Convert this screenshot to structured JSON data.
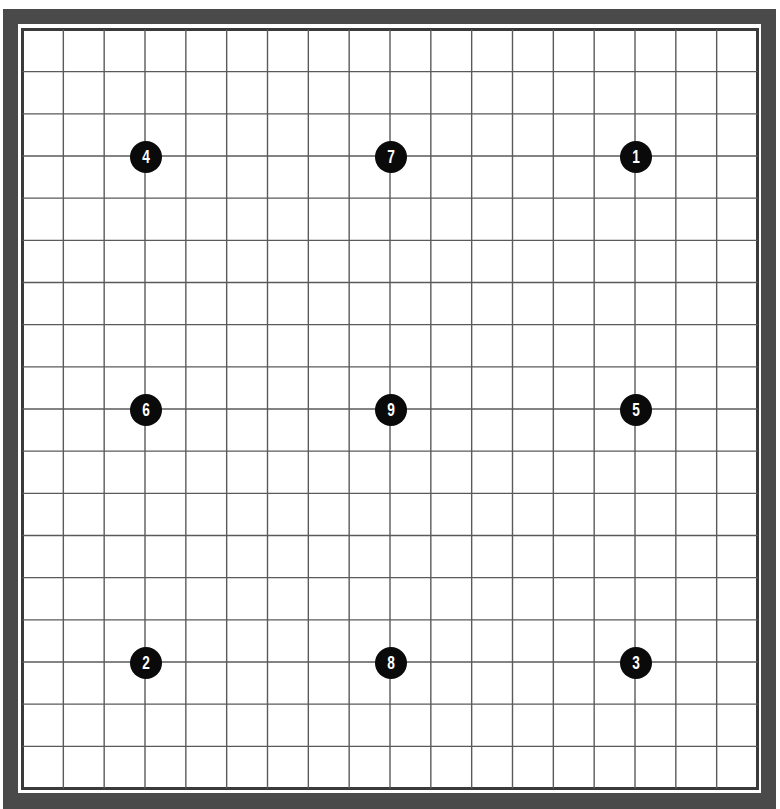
{
  "board": {
    "size": 19,
    "colors": {
      "background": "#ffffff",
      "frame": "#4a4a4a",
      "inner_frame": "#3a3a3a",
      "grid_line": "#5a5a5a",
      "stone": "#0a0a0a",
      "stone_label": "#ffffff"
    },
    "stones": [
      {
        "label": "1",
        "col": 15,
        "row": 3,
        "color": "black"
      },
      {
        "label": "2",
        "col": 3,
        "row": 15,
        "color": "black"
      },
      {
        "label": "3",
        "col": 15,
        "row": 15,
        "color": "black"
      },
      {
        "label": "4",
        "col": 3,
        "row": 3,
        "color": "black"
      },
      {
        "label": "5",
        "col": 15,
        "row": 9,
        "color": "black"
      },
      {
        "label": "6",
        "col": 3,
        "row": 9,
        "color": "black"
      },
      {
        "label": "7",
        "col": 9,
        "row": 3,
        "color": "black"
      },
      {
        "label": "8",
        "col": 9,
        "row": 15,
        "color": "black"
      },
      {
        "label": "9",
        "col": 9,
        "row": 9,
        "color": "black"
      }
    ]
  }
}
